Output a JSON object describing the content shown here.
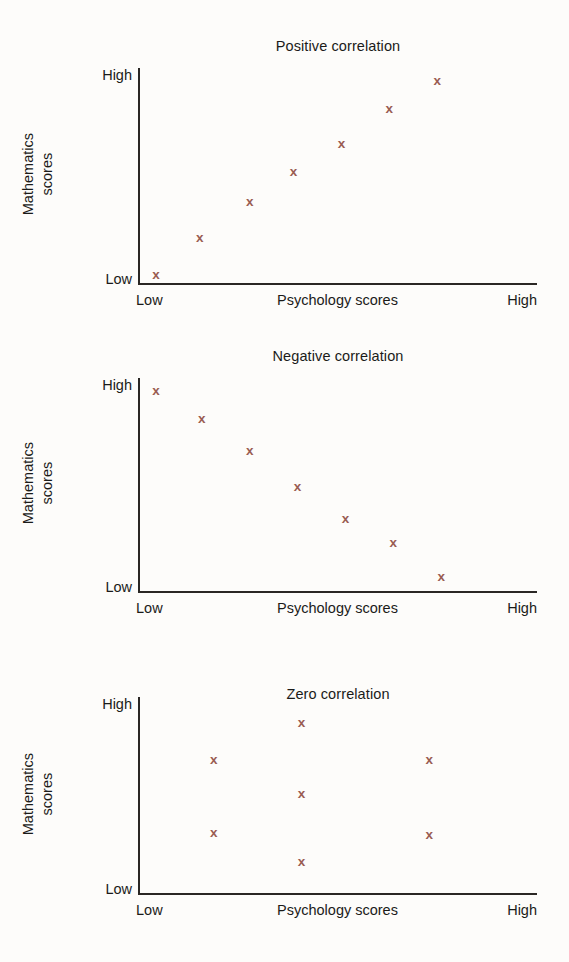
{
  "figure": {
    "width": 569,
    "height": 962,
    "background": "#fdfcfa",
    "marker_color": "#9a5c52",
    "axis_color": "#2a2724",
    "text_color": "#1b1b19",
    "marker_glyph": "x"
  },
  "labels": {
    "y_high": "High",
    "y_low": "Low",
    "x_low": "Low",
    "x_high": "High",
    "y_axis_title_line1": "Mathematics",
    "y_axis_title_line2": "scores",
    "x_axis_title": "Psychology scores"
  },
  "chart_data": [
    {
      "type": "scatter",
      "title": "Positive correlation",
      "xlabel": "Psychology scores",
      "ylabel": "Mathematics scores",
      "xlim": [
        0,
        100
      ],
      "ylim": [
        0,
        100
      ],
      "xtick_labels": [
        "Low",
        "High"
      ],
      "ytick_labels": [
        "Low",
        "High"
      ],
      "grid": false,
      "legend": false,
      "marker": "x",
      "x": [
        4.5,
        15.5,
        28,
        39,
        51,
        63,
        75
      ],
      "y": [
        4,
        21,
        38,
        52,
        65,
        81,
        94
      ]
    },
    {
      "type": "scatter",
      "title": "Negative correlation",
      "xlabel": "Psychology scores",
      "ylabel": "Mathematics scores",
      "xlim": [
        0,
        100
      ],
      "ylim": [
        0,
        100
      ],
      "xtick_labels": [
        "Low",
        "High"
      ],
      "ytick_labels": [
        "Low",
        "High"
      ],
      "grid": false,
      "legend": false,
      "marker": "x",
      "x": [
        4.5,
        16,
        28,
        40,
        52,
        64,
        76
      ],
      "y": [
        94,
        81,
        66,
        49,
        34,
        23,
        7
      ]
    },
    {
      "type": "scatter",
      "title": "Zero correlation",
      "xlabel": "Psychology scores",
      "ylabel": "Mathematics scores",
      "xlim": [
        0,
        100
      ],
      "ylim": [
        0,
        100
      ],
      "xtick_labels": [
        "Low",
        "High"
      ],
      "ytick_labels": [
        "Low",
        "High"
      ],
      "grid": false,
      "legend": false,
      "marker": "x",
      "x": [
        41,
        19,
        73,
        41,
        19,
        73,
        41
      ],
      "y": [
        87,
        68,
        68,
        51,
        31,
        30,
        16
      ]
    }
  ]
}
